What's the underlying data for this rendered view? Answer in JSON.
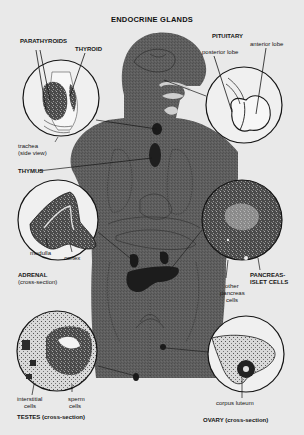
{
  "title": "ENDOCRINE GLANDS",
  "glands": {
    "pituitary": {
      "label": "PITUITARY",
      "parts": [
        "posterior lobe",
        "anterior lobe"
      ]
    },
    "thyroid": {
      "labels": [
        "PARATHYROIDS",
        "THYROID"
      ],
      "sublabel_line1": "trachea",
      "sublabel_line2": "(side view)"
    },
    "thymus": {
      "label": "THYMUS"
    },
    "adrenal": {
      "label": "ADRENAL",
      "sublabel": "(cross-section)",
      "parts": [
        "medulla",
        "cortex"
      ]
    },
    "pancreas": {
      "label_line1": "PANCREAS-",
      "label_line2": "ISLET CELLS",
      "other_line1": "other",
      "other_line2": "pancreas",
      "other_line3": "cells"
    },
    "testes": {
      "label": "TESTES (cross-section)",
      "parts": [
        {
          "line1": "interstitial",
          "line2": "cells"
        },
        {
          "line1": "sperm",
          "line2": "cells"
        }
      ]
    },
    "ovary": {
      "label": "OVARY (cross-section)",
      "parts": [
        "corpus luteum"
      ]
    }
  },
  "colors": {
    "background": "#e9e9e9",
    "body": "#5d5d5d",
    "ink": "#151515",
    "circle_fill": "#f0f0f0"
  }
}
